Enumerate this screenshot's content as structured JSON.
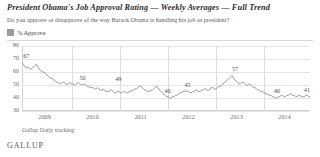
{
  "header": {
    "title": "President Obama's Job Approval Rating — Weekly Averages — Full Trend",
    "subtitle": "Do you approve or disapprove of the way Barack Obama is handling his job as president?"
  },
  "legend": {
    "label": "% Approve",
    "swatch_color": "#9a9a9a"
  },
  "footer": {
    "source": "Gallup Daily tracking",
    "brand": "GALLUP"
  },
  "chart_data": {
    "type": "line",
    "title": "President Obama's Job Approval Rating — Weekly Averages — Full Trend",
    "subtitle": "Do you approve or disapprove of the way Barack Obama is handling his job as president?",
    "xlabel": "",
    "ylabel": "",
    "ylim": [
      30,
      80
    ],
    "yticks": [
      80,
      70,
      60,
      50,
      40,
      30
    ],
    "xticks": [
      "2009",
      "2010",
      "2011",
      "2012",
      "2013",
      "2014"
    ],
    "grid": true,
    "legend_position": "top-left",
    "series": [
      {
        "name": "% Approve",
        "line_color": "#8e8e8e",
        "values": [
          67,
          66,
          64,
          63,
          64,
          63,
          62,
          63,
          64,
          65,
          66,
          64,
          62,
          61,
          60,
          60,
          59,
          58,
          57,
          56,
          55,
          55,
          54,
          53,
          52,
          52,
          51,
          51,
          52,
          52,
          51,
          50,
          51,
          52,
          51,
          51,
          50,
          50,
          51,
          52,
          51,
          50,
          50,
          51,
          50,
          49,
          49,
          48,
          48,
          48,
          47,
          47,
          48,
          47,
          46,
          46,
          47,
          46,
          45,
          45,
          45,
          46,
          46,
          45,
          44,
          44,
          45,
          45,
          44,
          44,
          45,
          45,
          44,
          44,
          45,
          45,
          46,
          46,
          47,
          47,
          48,
          49,
          49,
          48,
          47,
          46,
          46,
          45,
          45,
          46,
          46,
          47,
          48,
          49,
          48,
          46,
          45,
          44,
          43,
          42,
          41,
          41,
          40,
          40,
          41,
          41,
          42,
          42,
          43,
          44,
          44,
          45,
          45,
          46,
          45,
          45,
          44,
          44,
          45,
          45,
          46,
          46,
          45,
          45,
          46,
          46,
          47,
          47,
          46,
          46,
          47,
          48,
          48,
          47,
          47,
          48,
          49,
          49,
          50,
          51,
          52,
          53,
          54,
          55,
          56,
          57,
          56,
          54,
          53,
          52,
          51,
          51,
          52,
          52,
          51,
          50,
          50,
          51,
          50,
          49,
          48,
          48,
          47,
          46,
          46,
          45,
          45,
          44,
          44,
          43,
          43,
          42,
          42,
          41,
          41,
          40,
          40,
          41,
          41,
          42,
          42,
          41,
          41,
          42,
          42,
          43,
          43,
          42,
          42,
          41,
          41,
          42,
          42,
          41,
          41,
          41,
          42,
          42,
          41,
          41
        ]
      }
    ],
    "annotations": [
      {
        "text": "67",
        "value": 67,
        "position_pct": 1.5
      },
      {
        "text": "50",
        "value": 50,
        "position_pct": 21.0
      },
      {
        "text": "49",
        "value": 49,
        "position_pct": 33.5
      },
      {
        "text": "40",
        "value": 40,
        "position_pct": 50.5
      },
      {
        "text": "45",
        "value": 45,
        "position_pct": 57.5
      },
      {
        "text": "57",
        "value": 57,
        "position_pct": 74.0
      },
      {
        "text": "40",
        "value": 40,
        "position_pct": 88.5
      },
      {
        "text": "41",
        "value": 41,
        "position_pct": 99.0
      }
    ]
  }
}
